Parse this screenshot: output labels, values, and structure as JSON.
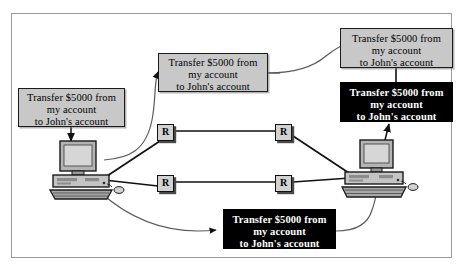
{
  "figure": {
    "type": "network-security-diagram",
    "title": "",
    "background_color": "#ffffff",
    "frame_color": "#9a9a9a"
  },
  "message_text": {
    "line1": "Transfer $5000 from",
    "line2": "my account",
    "line3": "to John's account"
  },
  "boxes": [
    {
      "id": "msg-source",
      "role": "plaintext-at-sender",
      "style": "plain",
      "background": "#c8c8c8",
      "text_color": "#000000",
      "line1": "Transfer $5000 from",
      "line2": "my account",
      "line3": "to John's account"
    },
    {
      "id": "msg-relay",
      "role": "plaintext-in-transit",
      "style": "plain",
      "background": "#c8c8c8",
      "text_color": "#000000",
      "line1": "Transfer $5000 from",
      "line2": "my account",
      "line3": "to John's account"
    },
    {
      "id": "msg-dest",
      "role": "plaintext-at-receiver",
      "style": "plain",
      "background": "#c8c8c8",
      "text_color": "#000000",
      "line1": "Transfer $5000 from",
      "line2": "my account",
      "line3": "to John's account"
    },
    {
      "id": "msg-intercept-top",
      "role": "intercepted-copy",
      "style": "cipher",
      "background": "#000000",
      "text_color": "#ffffff",
      "line1": "Transfer $5000 from",
      "line2": "my account",
      "line3": "to John's account"
    },
    {
      "id": "msg-intercept-bottom",
      "role": "intercepted-copy",
      "style": "cipher",
      "background": "#000000",
      "text_color": "#ffffff",
      "line1": "Transfer $5000 from",
      "line2": "my account",
      "line3": "to John's account"
    }
  ],
  "routers": [
    {
      "id": "router-tl",
      "label": "R"
    },
    {
      "id": "router-tr",
      "label": "R"
    },
    {
      "id": "router-bl",
      "label": "R"
    },
    {
      "id": "router-br",
      "label": "R"
    }
  ],
  "computers": [
    {
      "id": "computer-left",
      "role": "sender"
    },
    {
      "id": "computer-right",
      "role": "receiver"
    }
  ]
}
